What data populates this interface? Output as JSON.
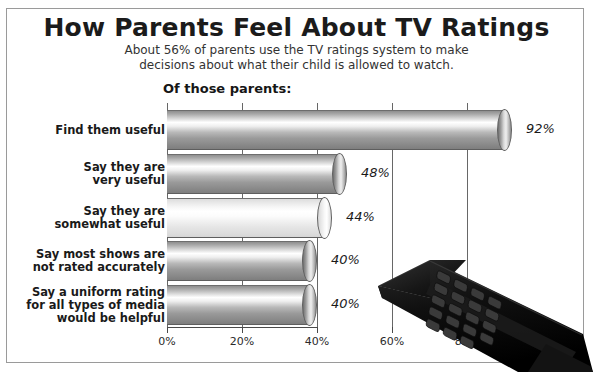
{
  "header": {
    "title": "How Parents Feel About TV Ratings",
    "subtitle_line1": "About 56% of parents use the TV ratings system to make",
    "subtitle_line2": "decisions about what their child is allowed to watch.",
    "section_note": "Of those parents:"
  },
  "chart_data": {
    "type": "bar",
    "orientation": "horizontal",
    "title": "How Parents Feel About TV Ratings",
    "subtitle": "About 56% of parents use the TV ratings system to make decisions about what their child is allowed to watch.",
    "annotation": "Of those parents:",
    "xlabel": "",
    "ylabel": "",
    "xlim": [
      0,
      92
    ],
    "grid": true,
    "legend": "none",
    "categories": [
      "Find them useful",
      "Say they are very useful",
      "Say they are somewhat useful",
      "Say most shows are not rated accurately",
      "Say a uniform rating for all types of media would be helpful"
    ],
    "values": [
      92,
      48,
      44,
      40,
      40
    ],
    "value_labels": [
      "92%",
      "48%",
      "44%",
      "40%",
      "40%"
    ],
    "xticks": [
      0,
      20,
      40,
      60,
      80
    ],
    "xtick_labels": [
      "0%",
      "20%",
      "40%",
      "60%",
      "80%"
    ]
  },
  "bars": [
    {
      "label_lines": [
        "Find them useful"
      ],
      "value": 92,
      "value_label": "92%",
      "shade": "dark"
    },
    {
      "label_lines": [
        "Say they are",
        "very useful"
      ],
      "value": 48,
      "value_label": "48%",
      "shade": "dark"
    },
    {
      "label_lines": [
        "Say they are",
        "somewhat useful"
      ],
      "value": 44,
      "value_label": "44%",
      "shade": "light"
    },
    {
      "label_lines": [
        "Say most shows are",
        "not rated accurately"
      ],
      "value": 40,
      "value_label": "40%",
      "shade": "dark"
    },
    {
      "label_lines": [
        "Say a uniform rating",
        "for all types of media",
        "would be helpful"
      ],
      "value": 40,
      "value_label": "40%",
      "shade": "dark"
    }
  ],
  "axis": {
    "ticks": [
      {
        "value": 0,
        "label": "0%"
      },
      {
        "value": 20,
        "label": "20%"
      },
      {
        "value": 40,
        "label": "40%"
      },
      {
        "value": 60,
        "label": "60%"
      },
      {
        "value": 80,
        "label": "80%"
      }
    ]
  },
  "decor": {
    "remote_icon": "tv-remote-control",
    "frame_color": "#9a9a9a",
    "bar_dark_color": "#9a9a9a",
    "bar_light_color": "#f0f0f0",
    "text_color": "#1a1a1a"
  }
}
